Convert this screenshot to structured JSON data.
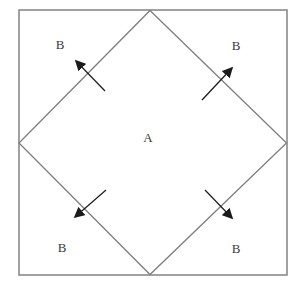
{
  "figure": {
    "labels": {
      "center": "A",
      "top_left": "B",
      "top_right": "B",
      "bottom_left": "B",
      "bottom_right": "B"
    },
    "colors": {
      "background": "#ffffff",
      "square_stroke": "#8a8a8a",
      "diamond_stroke": "#7e7e7e",
      "arrow": "#1b1b1b",
      "label_text": "#3a3a3a"
    }
  }
}
